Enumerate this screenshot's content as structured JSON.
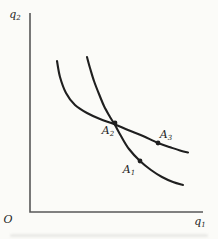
{
  "figure": {
    "background": "#fbfbf8",
    "ink": "#1f1f1f",
    "axis_color": "#585858",
    "axes": {
      "origin_label": "O",
      "y_label": {
        "base": "q",
        "sub": "2"
      },
      "x_label": {
        "base": "q",
        "sub": "1"
      },
      "y_axis": {
        "x": 30,
        "y_top": 13
      },
      "x_axis": {
        "y": 212,
        "x_right": 203
      }
    },
    "curves": [
      {
        "name": "flat-curve",
        "points": [
          [
            57,
            61
          ],
          [
            60,
            77
          ],
          [
            66,
            93
          ],
          [
            75,
            105
          ],
          [
            87,
            113
          ],
          [
            100,
            119
          ],
          [
            114,
            124
          ],
          [
            128,
            130
          ],
          [
            143,
            136
          ],
          [
            158,
            143
          ],
          [
            171,
            147.5
          ],
          [
            180,
            150.5
          ],
          [
            188,
            152.5
          ]
        ]
      },
      {
        "name": "steep-curve",
        "points": [
          [
            87,
            57
          ],
          [
            90,
            68
          ],
          [
            94,
            81
          ],
          [
            99,
            94
          ],
          [
            104,
            106
          ],
          [
            110,
            117
          ],
          [
            115,
            125
          ],
          [
            121,
            136
          ],
          [
            129,
            149
          ],
          [
            140,
            161
          ],
          [
            151,
            170
          ],
          [
            162,
            177
          ],
          [
            173,
            182
          ],
          [
            183,
            185
          ]
        ]
      }
    ],
    "points": [
      {
        "label_base": "A",
        "label_sub": "2",
        "x": 115,
        "y": 123,
        "label_x": 108,
        "label_y": 131
      },
      {
        "label_base": "A",
        "label_sub": "3",
        "x": 158,
        "y": 143,
        "label_x": 166,
        "label_y": 135
      },
      {
        "label_base": "A",
        "label_sub": "1",
        "x": 140,
        "y": 161,
        "label_x": 129,
        "label_y": 170
      }
    ]
  }
}
